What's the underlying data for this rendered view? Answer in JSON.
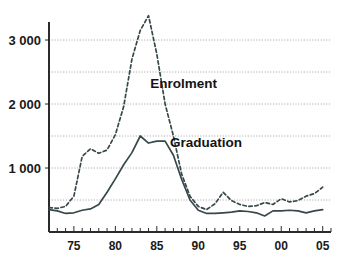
{
  "chart_data": {
    "type": "line",
    "title": "",
    "xlabel": "",
    "ylabel": "",
    "xlim": [
      1972,
      2006
    ],
    "ylim": [
      0,
      3500
    ],
    "yticks": [
      1000,
      2000,
      3000
    ],
    "ytick_labels": [
      "1 000",
      "2 000",
      "3 000"
    ],
    "gridlines": [
      500,
      1000,
      1500,
      2000,
      2500,
      3000
    ],
    "grid": true,
    "xticks": [
      1975,
      1980,
      1985,
      1990,
      1995,
      2000,
      2005
    ],
    "xtick_labels": [
      "75",
      "80",
      "85",
      "90",
      "95",
      "00",
      "05"
    ],
    "xtick_minor_every": 1,
    "legend": "inline-annotations",
    "annotations": [
      {
        "text": "Enrolment",
        "x": 1984.2,
        "y": 2250
      },
      {
        "text": "Graduation",
        "x": 1986.6,
        "y": 1330
      }
    ],
    "series": [
      {
        "name": "Enrolment",
        "style": "dashed",
        "color": "#37484a",
        "x": [
          1972,
          1973,
          1974,
          1975,
          1976,
          1977,
          1978,
          1979,
          1980,
          1981,
          1982,
          1983,
          1984,
          1985,
          1986,
          1987,
          1988,
          1989,
          1990,
          1991,
          1992,
          1993,
          1994,
          1995,
          1996,
          1997,
          1998,
          1999,
          2000,
          2001,
          2002,
          2003,
          2004,
          2005
        ],
        "values": [
          380,
          370,
          400,
          560,
          1180,
          1300,
          1230,
          1280,
          1520,
          1960,
          2700,
          3150,
          3380,
          2780,
          2000,
          1500,
          900,
          560,
          400,
          350,
          440,
          620,
          490,
          430,
          400,
          410,
          460,
          430,
          520,
          470,
          490,
          560,
          600,
          700
        ]
      },
      {
        "name": "Graduation",
        "style": "solid",
        "color": "#37484a",
        "x": [
          1972,
          1973,
          1974,
          1975,
          1976,
          1977,
          1978,
          1979,
          1980,
          1981,
          1982,
          1983,
          1984,
          1985,
          1986,
          1987,
          1988,
          1989,
          1990,
          1991,
          1992,
          1993,
          1994,
          1995,
          1996,
          1997,
          1998,
          1999,
          2000,
          2001,
          2002,
          2003,
          2004,
          2005
        ],
        "values": [
          350,
          330,
          290,
          300,
          340,
          360,
          430,
          620,
          830,
          1050,
          1240,
          1500,
          1390,
          1420,
          1420,
          1200,
          820,
          500,
          340,
          290,
          290,
          300,
          310,
          330,
          320,
          300,
          250,
          330,
          330,
          340,
          330,
          300,
          330,
          350
        ]
      }
    ]
  }
}
